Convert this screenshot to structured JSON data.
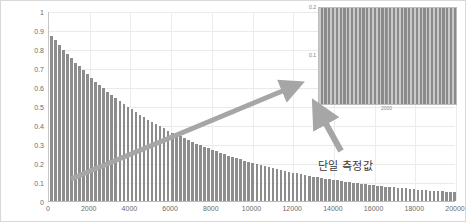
{
  "chart_data": [
    {
      "id": "main",
      "type": "bar",
      "title": "",
      "xlabel": "",
      "ylabel": "",
      "xlim": [
        0,
        20000
      ],
      "ylim": [
        0,
        1
      ],
      "grid": true,
      "legend": "none",
      "bar_color": "#8d8d8d",
      "description": "Exponential decay of measured value versus count",
      "x_ticks": [
        0,
        2000,
        4000,
        6000,
        8000,
        10000,
        12000,
        14000,
        16000,
        18000,
        20000
      ],
      "y_ticks": [
        0,
        0.1,
        0.2,
        0.3,
        0.4,
        0.5,
        0.6,
        0.7,
        0.8,
        0.9,
        1
      ],
      "x_tick_labels": [
        "0",
        "2000",
        "4000",
        "6000",
        "8000",
        "10000",
        "12000",
        "14000",
        "16000",
        "18000",
        "20000"
      ],
      "y_tick_labels": [
        "0",
        "0.1",
        "0.2",
        "0.3",
        "0.4",
        "0.5",
        "0.6",
        "0.7",
        "0.8",
        "0.9",
        "1"
      ],
      "x": [
        0,
        200,
        400,
        600,
        800,
        1000,
        1200,
        1400,
        1600,
        1800,
        2000,
        2200,
        2400,
        2600,
        2800,
        3000,
        3200,
        3400,
        3600,
        3800,
        4000,
        4200,
        4400,
        4600,
        4800,
        5000,
        5200,
        5400,
        5600,
        5800,
        6000,
        6200,
        6400,
        6600,
        6800,
        7000,
        7200,
        7400,
        7600,
        7800,
        8000,
        8200,
        8400,
        8600,
        8800,
        9000,
        9200,
        9400,
        9600,
        9800,
        10000,
        10200,
        10400,
        10600,
        10800,
        11000,
        11200,
        11400,
        11600,
        11800,
        12000,
        12200,
        12400,
        12600,
        12800,
        13000,
        13200,
        13400,
        13600,
        13800,
        14000,
        14200,
        14400,
        14600,
        14800,
        15000,
        15200,
        15400,
        15600,
        15800,
        16000,
        16200,
        16400,
        16600,
        16800,
        17000,
        17200,
        17400,
        17600,
        17800,
        18000,
        18200,
        18400,
        18600,
        18800,
        19000,
        19200,
        19400,
        19600,
        19800,
        20000
      ],
      "values": [
        0.87,
        0.845,
        0.82,
        0.796,
        0.773,
        0.751,
        0.729,
        0.708,
        0.687,
        0.667,
        0.648,
        0.629,
        0.611,
        0.593,
        0.576,
        0.559,
        0.543,
        0.527,
        0.512,
        0.497,
        0.483,
        0.469,
        0.455,
        0.442,
        0.429,
        0.417,
        0.405,
        0.393,
        0.382,
        0.371,
        0.36,
        0.35,
        0.34,
        0.33,
        0.32,
        0.311,
        0.302,
        0.293,
        0.285,
        0.277,
        0.269,
        0.261,
        0.253,
        0.246,
        0.239,
        0.232,
        0.225,
        0.219,
        0.212,
        0.206,
        0.2,
        0.194,
        0.189,
        0.183,
        0.178,
        0.173,
        0.168,
        0.163,
        0.158,
        0.154,
        0.149,
        0.145,
        0.141,
        0.137,
        0.133,
        0.129,
        0.125,
        0.122,
        0.118,
        0.115,
        0.111,
        0.108,
        0.105,
        0.102,
        0.099,
        0.096,
        0.093,
        0.091,
        0.088,
        0.086,
        0.083,
        0.081,
        0.078,
        0.076,
        0.074,
        0.072,
        0.07,
        0.068,
        0.066,
        0.064,
        0.062,
        0.06,
        0.058,
        0.057,
        0.055,
        0.054,
        0.052,
        0.051,
        0.049,
        0.048,
        0.046
      ]
    },
    {
      "id": "inset",
      "type": "bar",
      "title": "",
      "xlabel": "",
      "ylabel": "",
      "xlim": [
        0,
        4000
      ],
      "ylim": [
        0,
        0.2
      ],
      "grid": false,
      "legend": "none",
      "bar_color": "#8a8a8a",
      "description": "Zoomed-in view of individual measurement bars, all near 0.2",
      "x_ticks": [
        0,
        2000
      ],
      "y_ticks": [
        0,
        0.1,
        0.2
      ],
      "x_tick_labels": [
        "0",
        "2000"
      ],
      "y_tick_labels": [
        "0",
        "0.1",
        "0.2"
      ],
      "bar_count": 36,
      "values": [
        0.2,
        0.2,
        0.2,
        0.2,
        0.2,
        0.2,
        0.2,
        0.2,
        0.2,
        0.2,
        0.2,
        0.2,
        0.2,
        0.2,
        0.2,
        0.2,
        0.2,
        0.2,
        0.2,
        0.2,
        0.2,
        0.2,
        0.2,
        0.2,
        0.2,
        0.2,
        0.2,
        0.2,
        0.2,
        0.2,
        0.2,
        0.2,
        0.2,
        0.2,
        0.2,
        0.2
      ]
    }
  ],
  "annotations": {
    "single_measurement_label": "단일 측정값",
    "zoom_arrow_name": "zoom-callout-arrow",
    "pointer_arrow_name": "single-measurement-arrow",
    "arrow_color": "#a6a6a6"
  },
  "colors": {
    "bar": "#8d8d8d",
    "grid": "#eaeaea",
    "axis": "#b9b9b9",
    "tick_text": "#6b6b6b",
    "frame": "#d9d9d9",
    "arrow": "#a6a6a6",
    "inset_fill": "#9b9b9b"
  }
}
